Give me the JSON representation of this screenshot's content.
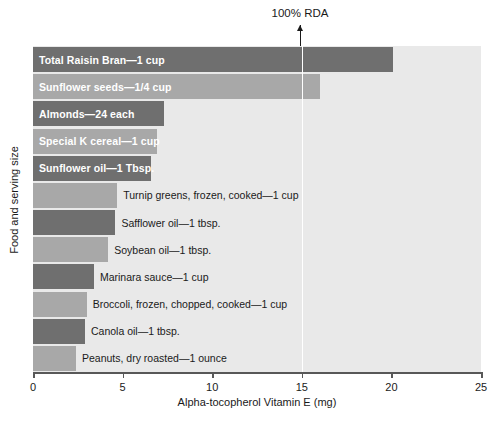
{
  "chart_data": {
    "type": "bar",
    "orientation": "horizontal",
    "title": "",
    "xlabel": "Alpha-tocopherol Vitamin E (mg)",
    "ylabel": "Food and serving size",
    "xlim": [
      0,
      25
    ],
    "xticks": [
      0,
      5,
      10,
      15,
      20,
      25
    ],
    "xtick_labels": [
      "0",
      "5",
      "10",
      "15",
      "20",
      "25"
    ],
    "grid": false,
    "legend": "none",
    "categories": [
      "Total Raisin Bran—1 cup",
      "Sunflower seeds—1/4 cup",
      "Almonds—24 each",
      "Special K cereal—1 cup",
      "Sunflower oil—1 Tbsp.",
      "Turnip greens, frozen, cooked—1 cup",
      "Safflower oil—1 tbsp.",
      "Soybean oil—1 tbsp.",
      "Marinara sauce—1 cup",
      "Broccoli, frozen, chopped, cooked—1 cup",
      "Canola oil—1 tbsp.",
      "Peanuts, dry roasted—1 ounce"
    ],
    "values": [
      20.1,
      16.0,
      7.3,
      6.9,
      6.6,
      4.7,
      4.6,
      4.2,
      3.4,
      3.0,
      2.9,
      2.4
    ],
    "label_inside": [
      true,
      true,
      true,
      true,
      true,
      false,
      false,
      false,
      false,
      false,
      false,
      false
    ],
    "bar_colors": [
      "#6f6f6f",
      "#a8a8a8",
      "#6f6f6f",
      "#a8a8a8",
      "#6f6f6f",
      "#a8a8a8",
      "#6f6f6f",
      "#a8a8a8",
      "#6f6f6f",
      "#a8a8a8",
      "#6f6f6f",
      "#a8a8a8"
    ],
    "annotations": [
      {
        "name": "rda-marker",
        "label": "100% RDA",
        "x_value": 15
      }
    ],
    "plot_background": "#e9e9e9",
    "rda_line_color": "#ffffff",
    "axis_color": "#585858"
  }
}
